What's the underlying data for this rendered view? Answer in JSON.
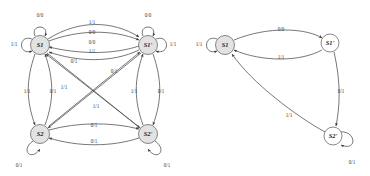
{
  "figure": {
    "type": "state-transition-diagram-pair",
    "background_color": "#ffffff",
    "node_fill_color": "#e2e2e2",
    "node_stroke_color": "#6a6a6a",
    "edge_color": "#4a4a4a",
    "text_color": "#1a1a1a"
  },
  "diagrams": [
    {
      "id": "left-diagram",
      "name": "full-product-machine",
      "nodes": [
        {
          "id": "S1",
          "label": "S1",
          "cx": 40,
          "cy": 45,
          "r": 9.5,
          "filled": true
        },
        {
          "id": "S1p",
          "label": "S1'",
          "cx": 148,
          "cy": 45,
          "r": 9.5,
          "filled": true
        },
        {
          "id": "S2",
          "label": "S2",
          "cx": 40,
          "cy": 134,
          "r": 9.5,
          "filled": true
        },
        {
          "id": "S2p",
          "label": "S2'",
          "cx": 148,
          "cy": 134,
          "r": 9.5,
          "filled": true
        }
      ],
      "self_loops": [
        {
          "node": "S1",
          "label": "0/0",
          "side": "top",
          "label_x": 40,
          "label_y": 16
        },
        {
          "node": "S1",
          "label": "1/1",
          "side": "left",
          "label_x": 14,
          "label_y": 45
        },
        {
          "node": "S1p",
          "label": "0/0",
          "side": "top",
          "label_x": 148,
          "label_y": 16
        },
        {
          "node": "S1p",
          "label": "1/1",
          "side": "right",
          "label_x": 173,
          "label_y": 45
        },
        {
          "node": "S2",
          "label": "0/1",
          "side": "bottom-left",
          "label_x": 19,
          "label_y": 166
        },
        {
          "node": "S2p",
          "label": "0/1",
          "side": "bottom-right",
          "label_x": 167,
          "label_y": 166
        }
      ],
      "edges": [
        {
          "from": "S1",
          "to": "S1p",
          "label": "1/1",
          "label_x": 92,
          "label_y": 23
        },
        {
          "from": "S1",
          "to": "S1p",
          "label": "0/0",
          "label_x": 92,
          "label_y": 33
        },
        {
          "from": "S1p",
          "to": "S1",
          "label": "0/0",
          "label_x": 92,
          "label_y": 43
        },
        {
          "from": "S1p",
          "to": "S1",
          "label": "1/1",
          "label_x": 92,
          "label_y": 52
        },
        {
          "from": "S1",
          "to": "S2",
          "label": "1/1",
          "label_x": 27,
          "label_y": 92
        },
        {
          "from": "S2",
          "to": "S1",
          "label": "0/1",
          "label_x": 53,
          "label_y": 92
        },
        {
          "from": "S1p",
          "to": "S2p",
          "label": "0/1",
          "label_x": 161,
          "label_y": 92
        },
        {
          "from": "S2p",
          "to": "S1p",
          "label": "1/1",
          "label_x": 134,
          "label_y": 92
        },
        {
          "from": "S1",
          "to": "S2p",
          "label": "0/1",
          "label_x": 74,
          "label_y": 62
        },
        {
          "from": "S1p",
          "to": "S2",
          "label": "0/1",
          "label_x": 114,
          "label_y": 72
        },
        {
          "from": "S2",
          "to": "S1p",
          "label": "1/1",
          "label_x": 64,
          "label_y": 88
        },
        {
          "from": "S2p",
          "to": "S1",
          "label": "1/1",
          "label_x": 96,
          "label_y": 107
        },
        {
          "from": "S2",
          "to": "S2p",
          "label": "0/1",
          "label_x": 94,
          "label_y": 126
        },
        {
          "from": "S2p",
          "to": "S2",
          "label": "0/1",
          "label_x": 94,
          "label_y": 142
        }
      ]
    },
    {
      "id": "right-diagram",
      "name": "reduced-machine",
      "nodes": [
        {
          "id": "S1",
          "label": "S1",
          "cx": 225,
          "cy": 45,
          "r": 9.5,
          "filled": true
        },
        {
          "id": "S1p",
          "label": "S1'",
          "cx": 330,
          "cy": 43,
          "r": 9.0,
          "filled": false
        },
        {
          "id": "S2p",
          "label": "S2'",
          "cx": 333,
          "cy": 136,
          "r": 9.0,
          "filled": false
        }
      ],
      "self_loops": [
        {
          "node": "S1",
          "label": "1/1",
          "side": "left",
          "label_x": 199,
          "label_y": 45
        },
        {
          "node": "S2p",
          "label": "0/1",
          "side": "bottom-right",
          "label_x": 352,
          "label_y": 163
        }
      ],
      "edges": [
        {
          "from": "S1",
          "to": "S1p",
          "label": "0/0",
          "label_x": 281,
          "label_y": 30
        },
        {
          "from": "S1p",
          "to": "S1",
          "label": "1/1",
          "label_x": 281,
          "label_y": 58
        },
        {
          "from": "S1p",
          "to": "S2p",
          "label": "0/1",
          "label_x": 341,
          "label_y": 92
        },
        {
          "from": "S2p",
          "to": "S1",
          "label": "1/1",
          "label_x": 289,
          "label_y": 116
        }
      ]
    }
  ]
}
